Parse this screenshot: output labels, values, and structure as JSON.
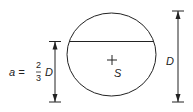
{
  "diagram": {
    "label_a": "a =",
    "frac_num": "2",
    "frac_den": "3",
    "label_a_D": "D",
    "center_label": "S",
    "diameter_label": "D",
    "stroke_color": "#222222"
  }
}
